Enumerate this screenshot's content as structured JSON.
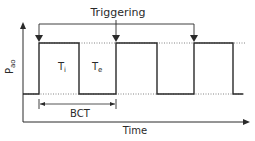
{
  "diagram": {
    "title_label": "Triggering",
    "y_axis_label": "P",
    "y_axis_subscript": "ao",
    "x_axis_label": "Time",
    "inspiratory_label": "T",
    "inspiratory_subscript": "i",
    "expiratory_label": "T",
    "expiratory_subscript": "e",
    "cycle_label": "BCT",
    "trigger_points": 3,
    "colors": {
      "line": "#2a2a2a",
      "dotted": "#555555",
      "background": "#ffffff"
    }
  }
}
